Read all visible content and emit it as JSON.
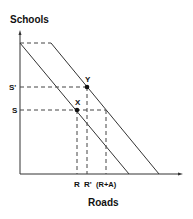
{
  "diagram": {
    "type": "production-possibility-frontier",
    "y_axis_label": "Schools",
    "x_axis_label": "Roads",
    "y_ticks": [
      {
        "label": "S'",
        "y": 87
      },
      {
        "label": "S",
        "y": 110
      }
    ],
    "x_ticks": [
      {
        "label": "R",
        "x": 77
      },
      {
        "label": "R'",
        "x": 87
      },
      {
        "label": "(R+A)",
        "x": 106
      }
    ],
    "points": [
      {
        "label": "X",
        "x": 77,
        "y": 110
      },
      {
        "label": "Y",
        "x": 87,
        "y": 87
      }
    ],
    "lines": [
      {
        "name": "original-frontier",
        "from": [
          20,
          43
        ],
        "to": [
          129,
          174
        ]
      },
      {
        "name": "shifted-frontier",
        "from": [
          51,
          43
        ],
        "to": [
          159,
          174
        ]
      }
    ],
    "colors": {
      "line": "#333333",
      "dash": "#444444",
      "text": "#111111"
    }
  }
}
